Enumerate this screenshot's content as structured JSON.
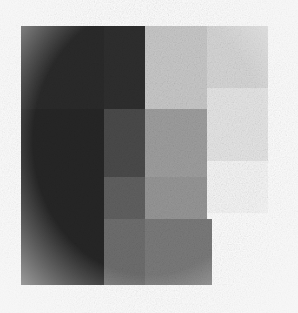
{
  "figure": {
    "kind": "grayscale-block-grid",
    "background_color": "#fdfdfd",
    "width": 298,
    "height": 313,
    "plot_area": {
      "x": 21,
      "y": 26,
      "width": 247,
      "height": 259
    },
    "texture": "film-grain"
  },
  "chart_data": {
    "type": "heatmap",
    "title": "",
    "subtitle": "",
    "xlabel": "",
    "ylabel": "",
    "grid": false,
    "legend": "none",
    "annotations": [],
    "colormap": "grayscale",
    "value_range": [
      0,
      255
    ],
    "note": "Staircase heatmap: column widths and row heights are unequal; the bottom row omits column 4 and the first row of column 4 is shorter, producing a stepped right/bottom edge.",
    "columns": [
      {
        "label": "c1",
        "x": 21,
        "width": 83
      },
      {
        "label": "c2",
        "x": 104,
        "width": 41
      },
      {
        "label": "c3",
        "x": 145,
        "width": 62
      },
      {
        "label": "c4",
        "x": 207,
        "width": 61
      }
    ],
    "rows": [
      {
        "label": "r1",
        "y": 26,
        "height": 83
      },
      {
        "label": "r2",
        "y": 109,
        "height": 68
      },
      {
        "label": "r3",
        "y": 177,
        "height": 42
      },
      {
        "label": "r4",
        "y": 219,
        "height": 66
      }
    ],
    "cells": [
      {
        "row": "r1",
        "col": "c1",
        "x": 21,
        "y": 26,
        "w": 83,
        "h": 83,
        "value": 42,
        "hex": "#2a2a2a"
      },
      {
        "row": "r1",
        "col": "c2",
        "x": 104,
        "y": 26,
        "w": 41,
        "h": 83,
        "value": 46,
        "hex": "#2e2e2e"
      },
      {
        "row": "r1",
        "col": "c3",
        "x": 145,
        "y": 26,
        "w": 62,
        "h": 83,
        "value": 200,
        "hex": "#c8c8c8"
      },
      {
        "row": "r1",
        "col": "c4",
        "x": 207,
        "y": 26,
        "w": 61,
        "h": 62,
        "value": 214,
        "hex": "#d6d6d6"
      },
      {
        "row": "r2",
        "col": "c1",
        "x": 21,
        "y": 109,
        "w": 83,
        "h": 68,
        "value": 38,
        "hex": "#262626"
      },
      {
        "row": "r2",
        "col": "c2",
        "x": 104,
        "y": 109,
        "w": 41,
        "h": 68,
        "value": 74,
        "hex": "#4a4a4a"
      },
      {
        "row": "r2",
        "col": "c3",
        "x": 145,
        "y": 109,
        "w": 62,
        "h": 68,
        "value": 158,
        "hex": "#9e9e9e"
      },
      {
        "row": "r2",
        "col": "c4",
        "x": 207,
        "y": 88,
        "w": 61,
        "h": 73,
        "value": 229,
        "hex": "#e5e5e5"
      },
      {
        "row": "r3",
        "col": "c1",
        "x": 21,
        "y": 177,
        "w": 83,
        "h": 42,
        "value": 38,
        "hex": "#262626"
      },
      {
        "row": "r3",
        "col": "c2",
        "x": 104,
        "y": 177,
        "w": 41,
        "h": 42,
        "value": 96,
        "hex": "#606060"
      },
      {
        "row": "r3",
        "col": "c3",
        "x": 145,
        "y": 177,
        "w": 62,
        "h": 42,
        "value": 150,
        "hex": "#969696"
      },
      {
        "row": "r3",
        "col": "c4",
        "x": 207,
        "y": 161,
        "w": 61,
        "h": 52,
        "value": 245,
        "hex": "#f5f5f5"
      },
      {
        "row": "r4",
        "col": "c1",
        "x": 21,
        "y": 219,
        "w": 83,
        "h": 66,
        "value": 38,
        "hex": "#262626"
      },
      {
        "row": "r4",
        "col": "c2",
        "x": 104,
        "y": 219,
        "w": 41,
        "h": 66,
        "value": 110,
        "hex": "#6e6e6e"
      },
      {
        "row": "r4",
        "col": "c3",
        "x": 145,
        "y": 219,
        "w": 67,
        "h": 66,
        "value": 122,
        "hex": "#7a7a7a"
      }
    ]
  }
}
